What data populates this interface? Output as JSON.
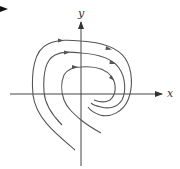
{
  "diagram": {
    "type": "phase-portrait",
    "axes": {
      "x_label": "x",
      "y_label": "y"
    },
    "trajectories": [
      {
        "name": "outer",
        "direction": "clockwise",
        "arrows": 2
      },
      {
        "name": "middle",
        "direction": "clockwise",
        "arrows": 2
      },
      {
        "name": "inner",
        "direction": "clockwise",
        "arrows": 2
      }
    ],
    "colors": {
      "curve": "#555555",
      "axis": "#444444",
      "background": "#ffffff"
    }
  }
}
